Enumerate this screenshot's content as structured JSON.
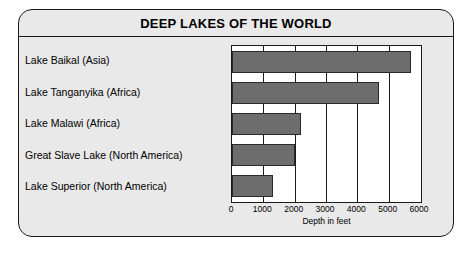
{
  "card": {
    "title": "DEEP LAKES OF THE WORLD",
    "background_color": "#e9e9e9",
    "border_color": "#1a1a1a"
  },
  "chart_data": {
    "type": "bar",
    "orientation": "horizontal",
    "title": "DEEP LAKES OF THE WORLD",
    "xlabel": "Depth in feet",
    "ylabel": "",
    "xlim": [
      0,
      6000
    ],
    "xticks": [
      0,
      1000,
      2000,
      3000,
      4000,
      5000,
      6000
    ],
    "xtick_labels": [
      "0",
      "1000",
      "2000",
      "3000",
      "4000",
      "5000",
      "6000"
    ],
    "grid": true,
    "legend": false,
    "bar_color": "#6d6d6d",
    "plot_background": "#ffffff",
    "categories": [
      "Lake Baikal (Asia)",
      "Lake Tanganyika (Africa)",
      "Lake Malawi (Africa)",
      "Great Slave Lake (North America)",
      "Lake Superior (North America)"
    ],
    "values": [
      5700,
      4700,
      2200,
      2000,
      1300
    ]
  }
}
